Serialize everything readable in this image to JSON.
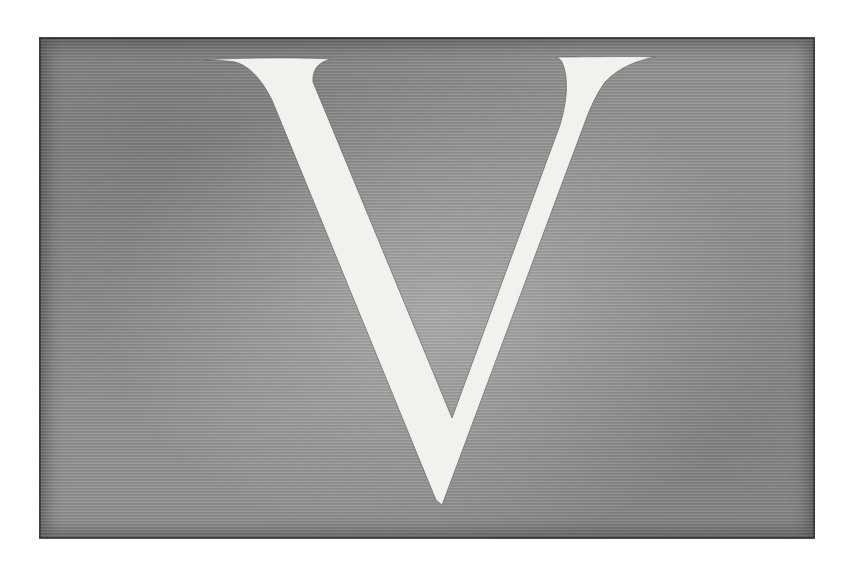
{
  "initial": {
    "letter": "V",
    "style": "decorative engraved initial",
    "letter_color": "#f2f1ee",
    "background_color": "#8f8f8f",
    "page_color": "#ffffff"
  }
}
